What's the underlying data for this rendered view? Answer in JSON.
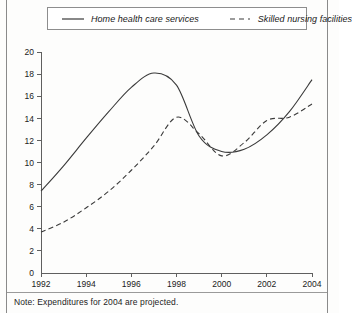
{
  "figure": {
    "note": "Note: Expenditures for 2004 are projected."
  },
  "legend": {
    "position": "top",
    "entries": [
      {
        "label": "Home health care services",
        "style": "solid",
        "icon": "solid-line-icon"
      },
      {
        "label": "Skilled nursing facilities",
        "style": "dashed",
        "icon": "dashed-line-icon"
      }
    ]
  },
  "chart_data": {
    "type": "line",
    "title": "",
    "subtitle": "",
    "xlabel": "",
    "ylabel": "",
    "xlim": [
      1992,
      2004
    ],
    "ylim": [
      0,
      20
    ],
    "grid": false,
    "legend_position": "top",
    "xticks": [
      1992,
      1994,
      1996,
      1998,
      2000,
      2002,
      2004
    ],
    "xtick_labels": [
      "1992",
      "1994",
      "1996",
      "1998",
      "2000",
      "2002",
      "2004"
    ],
    "yticks": [
      0,
      2,
      4,
      6,
      8,
      10,
      12,
      14,
      16,
      18,
      20
    ],
    "ytick_labels": [
      "0",
      "2",
      "4",
      "6",
      "8",
      "10",
      "12",
      "14",
      "16",
      "18",
      "20"
    ],
    "x": [
      1992,
      1993,
      1994,
      1995,
      1996,
      1997,
      1998,
      1999,
      2000,
      2001,
      2002,
      2003,
      2004
    ],
    "series": [
      {
        "name": "Home health care services",
        "style": "solid",
        "color": "#3a3a3a",
        "values": [
          7.4,
          9.7,
          12.2,
          14.6,
          16.8,
          18.1,
          17.0,
          12.4,
          11.0,
          11.2,
          12.5,
          14.6,
          17.5
        ]
      },
      {
        "name": "Skilled nursing facilities",
        "style": "dashed",
        "color": "#3a3a3a",
        "values": [
          3.7,
          4.6,
          5.9,
          7.4,
          9.3,
          11.5,
          14.1,
          12.6,
          10.6,
          11.8,
          13.8,
          14.1,
          15.3
        ]
      }
    ],
    "annotations": [
      "Note: Expenditures for 2004 are projected."
    ]
  }
}
